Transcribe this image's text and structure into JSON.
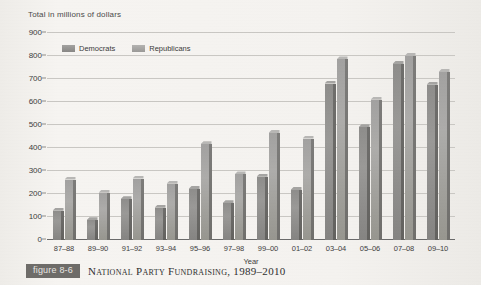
{
  "axis_title": "Total in millions of dollars",
  "legend": [
    {
      "key": "dem",
      "label": "Democrats"
    },
    {
      "key": "rep",
      "label": "Republicans"
    }
  ],
  "caption": {
    "figure_number": "figure 8-6",
    "title": "National Party Fundraising, 1989–2010"
  },
  "colors": {
    "democrats": "#8e8d8b",
    "republicans": "#a2a1a0",
    "gridline": "#c9c7c3",
    "axis": "#6a6a6a",
    "badge": "#6e6c69",
    "background": "#f3f1ee"
  },
  "chart_data": {
    "type": "bar",
    "title": "National Party Fundraising, 1989–2010",
    "xlabel": "Year",
    "ylabel": "Total in millions of dollars",
    "ylim": [
      0,
      900
    ],
    "ytick_step": 100,
    "yticks": [
      900,
      800,
      700,
      600,
      500,
      400,
      300,
      200,
      100,
      0
    ],
    "grid": true,
    "legend_position": "top-left",
    "categories": [
      "87–88",
      "89–90",
      "91–92",
      "93–94",
      "95–96",
      "97–98",
      "99–00",
      "01–02",
      "03–04",
      "05–06",
      "07–08",
      "09–10"
    ],
    "series": [
      {
        "name": "Democrats",
        "values": [
          127,
          86,
          177,
          140,
          222,
          160,
          275,
          218,
          680,
          490,
          765,
          675
        ]
      },
      {
        "name": "Republicans",
        "values": [
          263,
          205,
          267,
          245,
          416,
          285,
          465,
          441,
          785,
          610,
          800,
          730
        ]
      }
    ]
  }
}
